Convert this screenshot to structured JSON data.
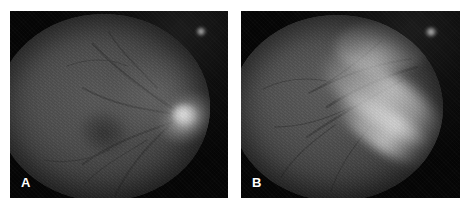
{
  "figure": {
    "type": "medical-photograph",
    "modality": "fundus photograph",
    "color_mode": "grayscale",
    "layout": "two panels side by side",
    "background_color": "#ffffff",
    "frame_color": "#080808",
    "label_color": "#ffffff",
    "panels": [
      {
        "id": "panel-a",
        "label": "A",
        "label_position": "bottom-left",
        "description": "Circular grayscale fundus image with a bright focal lesion in the temporal retina and a darker macular region nasal to it",
        "features": [
          {
            "name": "bright-lesion",
            "tone": "#e8e8e8",
            "position": "right-of-center"
          },
          {
            "name": "dark-macula",
            "tone": "#1a1a1a",
            "position": "center-left"
          },
          {
            "name": "rim-notch",
            "tone": "#ebebeb",
            "position": "top-right-rim"
          }
        ]
      },
      {
        "id": "panel-b",
        "label": "B",
        "label_position": "bottom-left",
        "description": "Circular grayscale fundus image showing a broad diagonal band of increased reflectance extending from the upper right toward the lower left",
        "features": [
          {
            "name": "bright-band",
            "tone": "#d6d6d6",
            "position": "diagonal-lower-right"
          },
          {
            "name": "bright-arc",
            "tone": "#d8d8d8",
            "position": "superior"
          },
          {
            "name": "rim-notch",
            "tone": "#ebebeb",
            "position": "top-right-rim"
          }
        ]
      }
    ]
  }
}
